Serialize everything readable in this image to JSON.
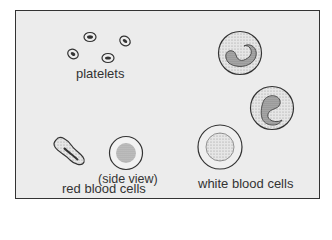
{
  "labels": {
    "platelets": "platelets",
    "side_view": "(side view)",
    "red_blood_cells": "red blood cells",
    "white_blood_cells": "white blood cells"
  },
  "colors": {
    "background": "#ececec",
    "outline": "#333333",
    "cell_fill": "#e4e4e4"
  }
}
